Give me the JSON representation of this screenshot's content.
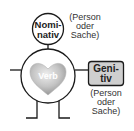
{
  "diagram": {
    "head": {
      "line1": "Nomi-",
      "line2": "nativ"
    },
    "head_note": {
      "line1": "(Person",
      "line2": "oder",
      "line3": "Sache)"
    },
    "heart": {
      "label": "Verb"
    },
    "box": {
      "line1": "Geni-",
      "line2": "tiv"
    },
    "box_note": {
      "line1": "(Person",
      "line2": "oder",
      "line3": "Sache)"
    },
    "colors": {
      "line": "#1a1a1a",
      "heart_light": "#e6e6e6",
      "heart_dark": "#9a9a9a",
      "box_fill": "#cfcfcf",
      "text": "#333333"
    }
  }
}
